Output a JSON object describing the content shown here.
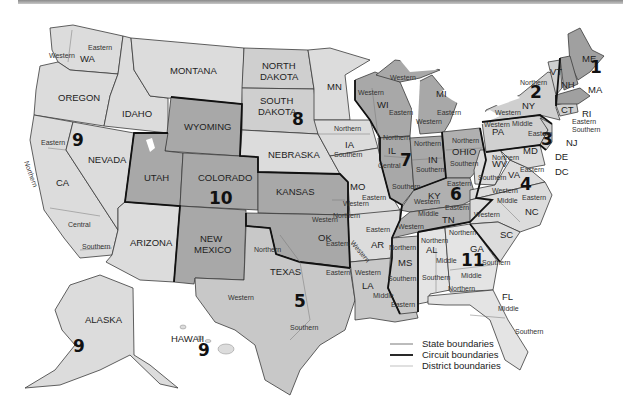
{
  "map": {
    "title": "",
    "colors": {
      "light": "#dcdcdc",
      "mid": "#c4c4c4",
      "dark": "#a8a8a8",
      "lake": "#ffffff"
    },
    "states": {
      "WA": "WA",
      "OREGON": "OREGON",
      "IDAHO": "IDAHO",
      "MONTANA": "MONTANA",
      "CA": "CA",
      "NEVADA": "NEVADA",
      "ARIZONA": "ARIZONA",
      "UTAH": "UTAH",
      "WYOMING": "WYOMING",
      "COLORADO": "COLORADO",
      "NEW_MEXICO_1": "NEW",
      "NEW_MEXICO_2": "MEXICO",
      "NORTH_DAKOTA_1": "NORTH",
      "NORTH_DAKOTA_2": "DAKOTA",
      "SOUTH_DAKOTA_1": "SOUTH",
      "SOUTH_DAKOTA_2": "DAKOTA",
      "NEBRASKA": "NEBRASKA",
      "KANSAS": "KANSAS",
      "OK": "OK",
      "TEXAS": "TEXAS",
      "MN": "MN",
      "IA": "IA",
      "MO": "MO",
      "AR": "AR",
      "LA": "LA",
      "WI": "WI",
      "IL": "IL",
      "MI": "MI",
      "IN": "IN",
      "OHIO": "OHIO",
      "KY": "KY",
      "TN": "TN",
      "MS": "MS",
      "AL": "AL",
      "GA": "GA",
      "FL": "FL",
      "SC": "SC",
      "NC": "NC",
      "VA": "VA",
      "WV": "WV",
      "PA": "PA",
      "NY": "NY",
      "VT": "VT",
      "NH": "NH",
      "ME": "ME",
      "MA": "MA",
      "CT": "CT",
      "RI": "RI",
      "NJ": "NJ",
      "DE": "DE",
      "MD": "MD",
      "DC": "DC",
      "ALASKA": "ALASKA",
      "HAWAII": "HAWAII"
    },
    "circuits": {
      "c1": "1",
      "c2": "2",
      "c3": "3",
      "c4": "4",
      "c5": "5",
      "c6": "6",
      "c7": "7",
      "c8": "8",
      "c9_west": "9",
      "c9_alaska": "9",
      "c9_hawaii": "9",
      "c10": "10",
      "c11": "11"
    },
    "districts": {
      "wa_western": "Western",
      "wa_eastern": "Eastern",
      "ca_eastern": "Eastern",
      "ca_northern": "Northern",
      "ca_central": "Central",
      "ca_southern": "Southern",
      "ia_northern": "Northern",
      "ia_southern": "Southern",
      "wi_western_top": "Western",
      "wi_western": "Western",
      "wi_eastern": "Eastern",
      "mi_eastern": "Eastern",
      "mi_western": "Western",
      "il_northern": "Northern",
      "il_central": "Central",
      "il_southern": "Southern",
      "in_northern": "Northern",
      "in_southern": "Southern",
      "oh_northern": "Northern",
      "oh_southern": "Southern",
      "ny_northern": "Northern",
      "ny_western": "Western",
      "ny_eastern": "Eastern",
      "ny_southern": "Southern",
      "pa_western": "Western",
      "pa_middle": "Middle",
      "pa_eastern": "Eastern",
      "wv_northern": "Northern",
      "wv_southern": "Southern",
      "va_eastern": "Eastern",
      "va_western": "Western",
      "nc_middle": "Middle",
      "nc_eastern": "Eastern",
      "nc_western": "Western",
      "ky_eastern": "Eastern",
      "ky_western": "Western",
      "tn_middle": "Middle",
      "tn_eastern": "Eastern",
      "tn_western": "Western",
      "mo_eastern": "Eastern",
      "mo_western": "Western",
      "ok_western": "Western",
      "ok_northern": "Northern",
      "ok_eastern": "Eastern",
      "ar_eastern": "Eastern",
      "ar_western": "Western",
      "tx_northern": "Northern",
      "tx_eastern": "Eastern",
      "tx_western": "Western",
      "tx_southern": "Southern",
      "la_western": "Western",
      "la_middle": "Middle",
      "la_eastern": "Eastern",
      "ms_northern": "Northern",
      "ms_southern": "Southern",
      "al_northern": "Northern",
      "al_middle": "Middle",
      "al_southern": "Southern",
      "ga_northern": "Northern",
      "ga_middle": "Middle",
      "ga_southern": "Southern",
      "fl_northern": "Northern",
      "fl_middle": "Middle",
      "fl_southern": "Southern"
    },
    "legend": {
      "state": "State boundaries",
      "circuit": "Circuit boundaries",
      "district": "District boundaries"
    }
  }
}
